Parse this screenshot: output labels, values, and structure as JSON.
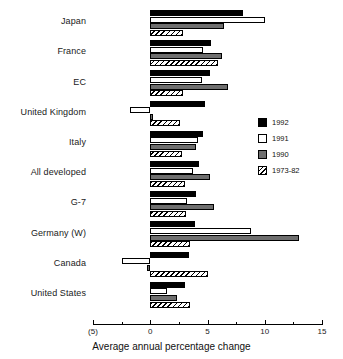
{
  "chart_data": {
    "type": "bar",
    "orientation": "horizontal",
    "title": "",
    "xlabel": "Average annual percentage change",
    "ylabel": "",
    "xlim": [
      -5,
      15
    ],
    "xticks": [
      -5,
      0,
      5,
      10,
      15
    ],
    "xtick_labels": [
      "(5)",
      "0",
      "5",
      "10",
      "15"
    ],
    "minor_ticks": [
      -2.5,
      2.5,
      7.5,
      12.5
    ],
    "grid": false,
    "legend_position": "right",
    "categories": [
      "Japan",
      "France",
      "EC",
      "United Kingdom",
      "Italy",
      "All developed",
      "G-7",
      "Germany (W)",
      "Canada",
      "United States"
    ],
    "series": [
      {
        "name": "1992",
        "color": "#000000",
        "values": [
          8.1,
          5.3,
          5.2,
          4.8,
          4.6,
          4.3,
          4.0,
          3.9,
          3.4,
          3.0
        ]
      },
      {
        "name": "1991",
        "color": "#ffffff",
        "values": [
          10.0,
          4.6,
          4.5,
          -1.8,
          4.2,
          3.7,
          3.2,
          8.8,
          -2.5,
          1.5
        ]
      },
      {
        "name": "1990",
        "color": "#6e6e6e",
        "values": [
          6.4,
          6.3,
          6.8,
          0.2,
          4.0,
          5.2,
          5.6,
          13.0,
          -0.3,
          2.3
        ]
      },
      {
        "name": "1973-82",
        "color": "hatched",
        "values": [
          2.9,
          5.9,
          2.9,
          2.6,
          2.8,
          3.0,
          3.1,
          3.5,
          5.0,
          3.5
        ]
      }
    ]
  },
  "legend": {
    "entries": [
      {
        "label": "1992",
        "swatch": "s1992"
      },
      {
        "label": "1991",
        "swatch": "s1991"
      },
      {
        "label": "1990",
        "swatch": "s1990"
      },
      {
        "label": "1973-82",
        "swatch": "s1973"
      }
    ]
  }
}
